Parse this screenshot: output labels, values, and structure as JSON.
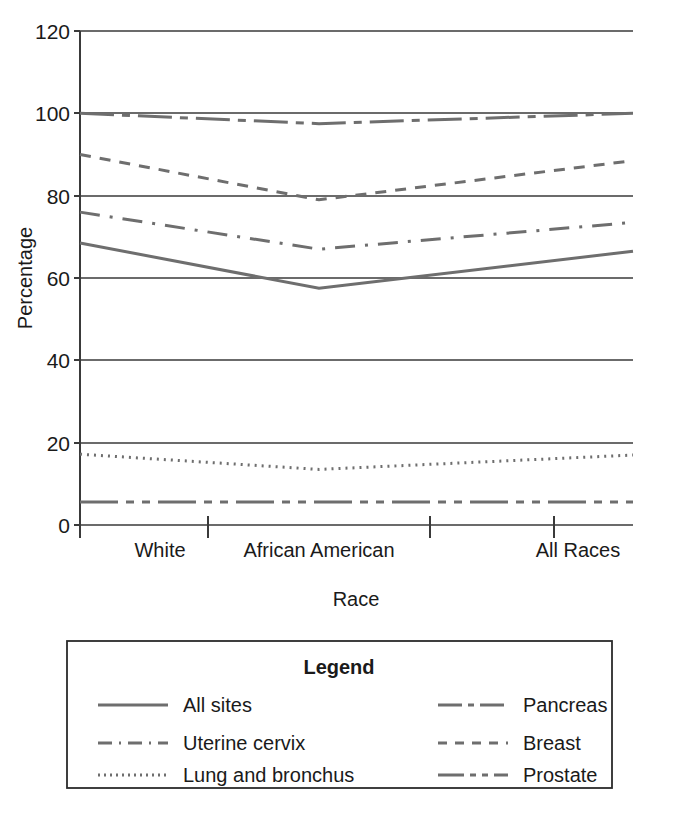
{
  "chart_data": {
    "type": "line",
    "title": "",
    "xlabel": "Race",
    "ylabel": "Percentage",
    "categories": [
      "White",
      "African American",
      "All Races"
    ],
    "ylim": [
      0,
      120
    ],
    "yticks": [
      0,
      20,
      40,
      60,
      80,
      100,
      120
    ],
    "ytick_labels": [
      "0",
      "20",
      "40",
      "60",
      "80",
      "100",
      "120"
    ],
    "grid": "horizontal",
    "legend_position": "below-plot",
    "legend_title": "Legend",
    "series": [
      {
        "name": "All sites",
        "dash": "solid",
        "values": [
          68.5,
          57.5,
          66.5
        ]
      },
      {
        "name": "Uterine cervix",
        "dash": "long-dash",
        "values": [
          76.0,
          67.0,
          73.5
        ]
      },
      {
        "name": "Lung and bronchus",
        "dash": "dotted",
        "values": [
          17.2,
          13.5,
          17.0
        ]
      },
      {
        "name": "Pancreas",
        "dash": "dash-dot",
        "values": [
          100.0,
          97.5,
          100.0
        ]
      },
      {
        "name": "Breast",
        "dash": "dashed",
        "values": [
          90.0,
          79.0,
          88.5
        ]
      },
      {
        "name": "Prostate",
        "dash": "dash-dot-dot",
        "values": [
          5.6,
          5.6,
          5.6
        ]
      }
    ]
  },
  "axes": {
    "y_title": "Percentage",
    "x_title": "Race",
    "y_labels": [
      "120",
      "100",
      "80",
      "60",
      "40",
      "20",
      "0"
    ],
    "x_labels": [
      "White",
      "African American",
      "All Races"
    ]
  },
  "legend": {
    "title": "Legend",
    "left_column": [
      {
        "label": "All sites",
        "swatch": "solid-line-icon"
      },
      {
        "label": "Uterine cervix",
        "swatch": "long-dash-line-icon"
      },
      {
        "label": "Lung and bronchus",
        "swatch": "dotted-line-icon"
      }
    ],
    "right_column": [
      {
        "label": "Pancreas",
        "swatch": "dash-dot-line-icon"
      },
      {
        "label": "Breast",
        "swatch": "dashed-line-icon"
      },
      {
        "label": "Prostate",
        "swatch": "dash-dot-dot-line-icon"
      }
    ]
  },
  "colors": {
    "line": "#6e6e6e",
    "axis": "#3a3a3a",
    "text": "#1a1a1a",
    "background": "#ffffff"
  }
}
